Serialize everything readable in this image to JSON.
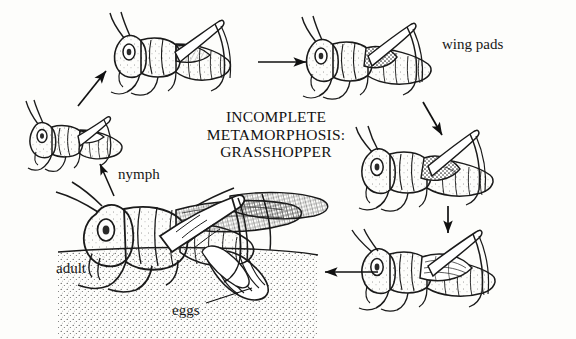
{
  "figure": {
    "title_lines": [
      "INCOMPLETE",
      "METAMORPHOSIS:",
      "GRASSHOPPER"
    ],
    "title_line1": "INCOMPLETE",
    "title_line2": "METAMORPHOSIS:",
    "title_line3": "GRASSHOPPER",
    "style": "black and white pen-and-ink line drawing",
    "background_color": "#fdfdfb",
    "ink_color": "#1a1a1a"
  },
  "labels": [
    {
      "id": "wing-pads",
      "text": "wing pads",
      "x": 442,
      "y": 36
    },
    {
      "id": "nymph",
      "text": "nymph",
      "x": 118,
      "y": 166
    },
    {
      "id": "adult",
      "text": "adult",
      "x": 56,
      "y": 260
    },
    {
      "id": "eggs",
      "text": "eggs",
      "x": 172,
      "y": 302
    }
  ],
  "stages": [
    {
      "id": "nymph-instar-1",
      "name": "first instar nymph",
      "position": "left-upper",
      "wings": "none"
    },
    {
      "id": "nymph-instar-2",
      "name": "second instar nymph",
      "position": "top-left",
      "wings": "none"
    },
    {
      "id": "nymph-instar-3",
      "name": "third instar nymph",
      "position": "top-right",
      "wings": "small wing pads"
    },
    {
      "id": "nymph-instar-4",
      "name": "fourth instar nymph",
      "position": "right-middle",
      "wings": "larger wing pads"
    },
    {
      "id": "nymph-instar-5",
      "name": "fifth instar nymph",
      "position": "right-lower",
      "wings": "full wing pads"
    },
    {
      "id": "adult",
      "name": "adult grasshopper laying eggs",
      "position": "bottom-left",
      "wings": "full wings"
    },
    {
      "id": "egg-pod",
      "name": "egg pod buried in soil",
      "position": "bottom-center",
      "wings": "n/a"
    }
  ],
  "arrows": [
    {
      "id": "arrow-eggs-to-nymph1",
      "direction": "up-right",
      "from": [
        78,
        106
      ],
      "to": [
        107,
        70
      ]
    },
    {
      "id": "arrow-nymph2-to-nymph3",
      "direction": "right",
      "from": [
        258,
        62
      ],
      "to": [
        307,
        62
      ]
    },
    {
      "id": "arrow-nymph3-to-nymph4",
      "direction": "down-right",
      "from": [
        423,
        102
      ],
      "to": [
        443,
        136
      ]
    },
    {
      "id": "arrow-nymph4-to-nymph5",
      "direction": "down",
      "from": [
        448,
        206
      ],
      "to": [
        448,
        234
      ]
    },
    {
      "id": "arrow-nymph5-to-adult",
      "direction": "left",
      "from": [
        378,
        272
      ],
      "to": [
        324,
        272
      ]
    }
  ],
  "leaders": [
    {
      "id": "leader-nymph",
      "from": [
        114,
        196
      ],
      "to": [
        99,
        163
      ]
    },
    {
      "id": "leader-eggs",
      "from": [
        205,
        303
      ],
      "to": [
        252,
        287
      ]
    }
  ]
}
